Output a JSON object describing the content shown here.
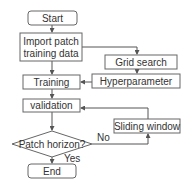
{
  "diagram": {
    "type": "flowchart",
    "nodes": {
      "start": {
        "label": "Start",
        "shape": "rounded-rect"
      },
      "import": {
        "line1": "Import  patch",
        "line2": "training data",
        "shape": "rect"
      },
      "grid_search": {
        "label": "Grid search",
        "shape": "rect"
      },
      "hyperparameter": {
        "label": "Hyperparameter",
        "shape": "rect"
      },
      "training": {
        "label": "Training",
        "shape": "rect"
      },
      "validation": {
        "label": "validation",
        "shape": "rect"
      },
      "decision": {
        "label": "Patch horizon?",
        "shape": "diamond"
      },
      "sliding_window": {
        "label": "Sliding window",
        "shape": "rect"
      },
      "end": {
        "label": "End",
        "shape": "rounded-rect"
      }
    },
    "edge_labels": {
      "no": "No",
      "yes": "Yes"
    },
    "edges": [
      [
        "start",
        "import"
      ],
      [
        "import",
        "training"
      ],
      [
        "import",
        "grid_search"
      ],
      [
        "grid_search",
        "hyperparameter"
      ],
      [
        "hyperparameter",
        "training"
      ],
      [
        "training",
        "validation"
      ],
      [
        "validation",
        "decision"
      ],
      [
        "decision",
        "sliding_window",
        "No"
      ],
      [
        "sliding_window",
        "validation"
      ],
      [
        "decision",
        "end",
        "Yes"
      ]
    ],
    "colors": {
      "stroke": "#666666",
      "text": "#333333",
      "background": "#ffffff"
    }
  }
}
